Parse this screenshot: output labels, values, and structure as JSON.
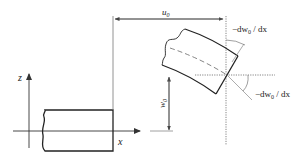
{
  "diagram": {
    "labels": {
      "z_axis": "z",
      "x_axis": "x",
      "u0": "u",
      "u0_sub": "0",
      "w0": "w",
      "w0_sub": "0",
      "slope_top_prefix": "−dw",
      "slope_top_sub": "0",
      "slope_top_suffix": " / dx",
      "slope_right_prefix": "−dw",
      "slope_right_sub": "0",
      "slope_right_suffix": " / dx"
    },
    "colors": {
      "beam_stroke": "#222222",
      "axis_stroke": "#333333",
      "guide_stroke": "#666666",
      "dimension_stroke": "#555555"
    }
  }
}
